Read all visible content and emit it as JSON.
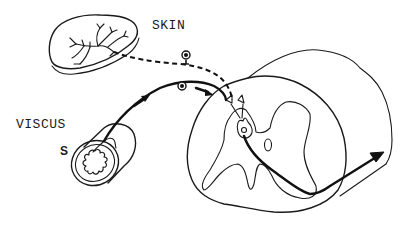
{
  "diagram": {
    "labels": {
      "skin": "SKIN",
      "viscus": "VISCUS",
      "s": "S"
    },
    "structures": [
      {
        "id": "skin-patch",
        "description": "skin patch with branching nerve endings"
      },
      {
        "id": "viscus-tube",
        "description": "visceral organ cross-section (hollow tube with folded mucosa)"
      },
      {
        "id": "spinal-cord",
        "description": "spinal cord segment cross-section with gray matter"
      },
      {
        "id": "dorsal-root-ganglion",
        "description": "two sensory neuron cell bodies"
      },
      {
        "id": "dorsal-horn-neuron",
        "description": "second-order neuron in dorsal horn"
      }
    ],
    "pathways": [
      {
        "id": "skin-afferent",
        "from": "skin",
        "to": "dorsal-horn",
        "style": "dashed"
      },
      {
        "id": "visceral-afferent",
        "from": "viscus",
        "to": "dorsal-horn",
        "style": "solid",
        "direction_arrows": 2
      },
      {
        "id": "ascending-tract",
        "from": "dorsal-horn",
        "to": "spinal-cord-exit",
        "style": "solid",
        "arrowhead": true
      }
    ],
    "colors": {
      "line": "#1a1a1a",
      "background": "#ffffff"
    }
  }
}
